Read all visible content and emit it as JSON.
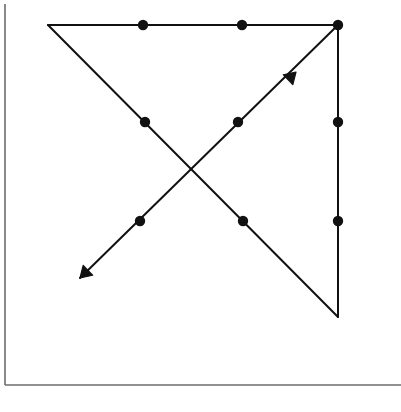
{
  "page": {
    "width": 401,
    "height": 412,
    "background_color": "#ffffff",
    "ink_color": "#111111",
    "frame_color": "#6b6b6b"
  },
  "frame": {
    "name": "page-frame",
    "left_border": {
      "x": 5,
      "y1": 4,
      "y2": 385
    },
    "bottom_border": {
      "y": 385,
      "x1": 5,
      "x2": 401
    },
    "stroke_width": 1.6
  },
  "diagram": {
    "title": "",
    "type": "geometric-line-figure",
    "stroke_width": 2,
    "node_radius": 5.2,
    "arrow_size": 11,
    "segments": [
      {
        "name": "top-horizontal-edge",
        "from": {
          "x": 48,
          "y": 25
        },
        "to": {
          "x": 338,
          "y": 25
        },
        "arrow": "none"
      },
      {
        "name": "right-vertical-edge",
        "from": {
          "x": 338,
          "y": 25
        },
        "to": {
          "x": 338,
          "y": 317
        },
        "arrow": "none"
      },
      {
        "name": "descending-diagonal",
        "from": {
          "x": 48,
          "y": 25
        },
        "to": {
          "x": 338,
          "y": 317
        },
        "arrow": "none"
      },
      {
        "name": "ascending-diagonal-arrow",
        "from": {
          "x": 80,
          "y": 278
        },
        "to": {
          "x": 338,
          "y": 25
        },
        "arrow": "both"
      }
    ],
    "arrowheads": [
      {
        "name": "arrowhead-down-left",
        "tip": {
          "x": 80,
          "y": 278
        },
        "direction": "down-left",
        "angle_deg": 224
      },
      {
        "name": "arrowhead-up-right",
        "tip": {
          "x": 296,
          "y": 72
        },
        "direction": "up-right",
        "angle_deg": 44
      }
    ],
    "nodes": [
      {
        "name": "node-top-mid-left",
        "x": 143,
        "y": 25,
        "row": 1,
        "col": 2
      },
      {
        "name": "node-top-mid-right",
        "x": 242,
        "y": 25,
        "row": 1,
        "col": 3
      },
      {
        "name": "node-top-right-corner",
        "x": 338,
        "y": 25,
        "row": 1,
        "col": 4
      },
      {
        "name": "node-mid-left",
        "x": 145,
        "y": 122,
        "row": 2,
        "col": 2
      },
      {
        "name": "node-mid-center",
        "x": 238,
        "y": 122,
        "row": 2,
        "col": 3
      },
      {
        "name": "node-mid-right",
        "x": 338,
        "y": 122,
        "row": 2,
        "col": 4
      },
      {
        "name": "node-low-left",
        "x": 140,
        "y": 221,
        "row": 3,
        "col": 2
      },
      {
        "name": "node-low-center",
        "x": 243,
        "y": 221,
        "row": 3,
        "col": 3
      },
      {
        "name": "node-low-right",
        "x": 338,
        "y": 221,
        "row": 3,
        "col": 4
      }
    ]
  },
  "chart_data": {
    "type": "scatter",
    "title": "",
    "subtitle": "",
    "xlabel": "",
    "ylabel": "",
    "xlim": [
      0,
      401
    ],
    "ylim": [
      412,
      0
    ],
    "grid": false,
    "legend": "none",
    "series": [
      {
        "name": "nodes",
        "marker": "filled-circle",
        "x": [
          143,
          242,
          338,
          145,
          238,
          338,
          140,
          243,
          338
        ],
        "y": [
          25,
          25,
          25,
          122,
          122,
          122,
          221,
          221,
          221
        ]
      },
      {
        "name": "top-horizontal-edge",
        "marker": "line",
        "x": [
          48,
          338
        ],
        "y": [
          25,
          25
        ]
      },
      {
        "name": "right-vertical-edge",
        "marker": "line",
        "x": [
          338,
          338
        ],
        "y": [
          25,
          317
        ]
      },
      {
        "name": "descending-diagonal",
        "marker": "line",
        "x": [
          48,
          338
        ],
        "y": [
          25,
          317
        ]
      },
      {
        "name": "ascending-diagonal-arrow",
        "marker": "line-double-arrow",
        "x": [
          80,
          338
        ],
        "y": [
          278,
          25
        ]
      }
    ],
    "annotations": [
      {
        "text": "",
        "name": "arrowhead-down-left",
        "x": 80,
        "y": 278
      },
      {
        "text": "",
        "name": "arrowhead-up-right",
        "x": 296,
        "y": 72
      }
    ]
  }
}
